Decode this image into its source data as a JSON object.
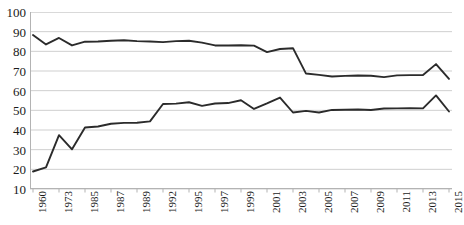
{
  "caption_fragment": "·     ·",
  "chart_data": {
    "type": "line",
    "title": "",
    "subtitle": "",
    "xlabel": "",
    "ylabel": "",
    "ylim": [
      10,
      100
    ],
    "ytick_step": 10,
    "yticks": [
      100,
      90,
      80,
      70,
      60,
      50,
      40,
      30,
      20,
      10
    ],
    "grid": true,
    "grid_axis": "y",
    "legend": null,
    "legend_position": "none",
    "xticklabels": [
      "1960",
      "1973",
      "1985",
      "1987",
      "1989",
      "1992",
      "1995",
      "1997",
      "1999",
      "2001",
      "2003",
      "2005",
      "2007",
      "2009",
      "2011",
      "2013",
      "2015"
    ],
    "x": [
      "1960",
      "1965",
      "1973",
      "1979",
      "1985",
      "1986",
      "1987",
      "1988",
      "1989",
      "1990",
      "1992",
      "1993",
      "1995",
      "1996",
      "1997",
      "1998",
      "1999",
      "2000",
      "2001",
      "2002",
      "2003",
      "2004",
      "2005",
      "2006",
      "2007",
      "2008",
      "2009",
      "2010",
      "2011",
      "2012",
      "2013",
      "2014",
      "2015"
    ],
    "series": [
      {
        "name": "upper-series",
        "color": "#2b2b2b",
        "values": [
          88.3,
          83.5,
          86.8,
          83.0,
          84.9,
          85.0,
          85.4,
          85.6,
          85.2,
          85.0,
          84.7,
          85.2,
          85.4,
          84.4,
          83.0,
          83.0,
          83.1,
          82.9,
          79.6,
          81.2,
          81.6,
          68.7,
          68.0,
          67.2,
          67.5,
          67.7,
          67.6,
          66.9,
          67.8,
          67.9,
          68.0,
          73.5,
          66.0
        ]
      },
      {
        "name": "lower-series",
        "color": "#2b2b2b",
        "values": [
          18.9,
          21.0,
          37.4,
          30.2,
          41.3,
          41.8,
          43.2,
          43.6,
          43.7,
          44.4,
          53.2,
          53.4,
          54.1,
          52.3,
          53.5,
          53.7,
          55.1,
          50.7,
          53.5,
          56.5,
          48.9,
          49.7,
          48.9,
          50.2,
          50.3,
          50.4,
          50.2,
          50.9,
          51.0,
          51.1,
          51.0,
          57.6,
          49.4
        ]
      }
    ],
    "axis_color": "#b3b3b3",
    "grid_color": "#cfcfcf",
    "background": "#ffffff"
  }
}
